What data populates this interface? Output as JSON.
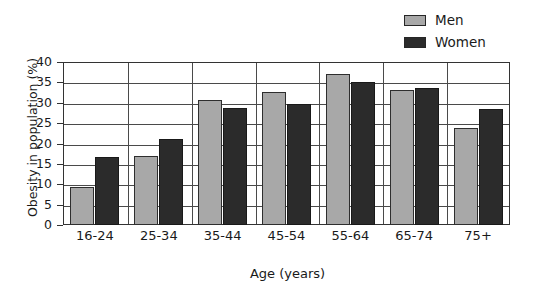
{
  "chart_data": {
    "type": "bar",
    "title": "",
    "xlabel": "Age (years)",
    "ylabel": "Obesity in population (%)",
    "categories": [
      "16-24",
      "25-34",
      "35-44",
      "45-54",
      "55-64",
      "65-74",
      "75+"
    ],
    "series": [
      {
        "name": "Men",
        "color": "#a8a8a8",
        "values": [
          9.3,
          17.0,
          30.6,
          32.6,
          37.0,
          33.2,
          23.7
        ]
      },
      {
        "name": "Women",
        "color": "#2b2b2b",
        "values": [
          16.7,
          21.0,
          28.8,
          29.6,
          35.2,
          33.7,
          28.5
        ]
      }
    ],
    "ylim": [
      0,
      40
    ],
    "ytick_step": 5,
    "yticks": [
      0,
      5,
      10,
      15,
      20,
      25,
      30,
      35,
      40
    ],
    "ytick_labels": [
      "0",
      "5",
      "10",
      "15",
      "20",
      "25",
      "30",
      "35",
      "40"
    ],
    "grid": "horizontal-and-category-separators",
    "legend_position": "top-right"
  },
  "legend": {
    "items": [
      {
        "label": "Men",
        "swatch": "men-swatch"
      },
      {
        "label": "Women",
        "swatch": "women-swatch"
      }
    ]
  }
}
